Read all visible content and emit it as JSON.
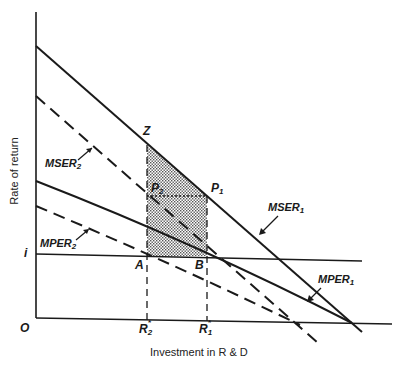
{
  "diagram": {
    "title": "",
    "y_axis_label": "Rate of return",
    "x_axis_label": "Investment in R & D",
    "origin_label": "O",
    "interest_rate_label": "i",
    "curves": [
      {
        "name": "MSER",
        "sub": "1",
        "style": "solid"
      },
      {
        "name": "MSER",
        "sub": "2",
        "style": "dashed"
      },
      {
        "name": "MPER",
        "sub": "1",
        "style": "solid"
      },
      {
        "name": "MPER",
        "sub": "2",
        "style": "dashed"
      }
    ],
    "points": {
      "Z": "Z",
      "P1": "P",
      "P1_sub": "1",
      "P2": "P",
      "P2_sub": "2",
      "A": "A",
      "B": "B"
    },
    "x_ticks": [
      {
        "label": "R",
        "sup": "*",
        "sub": "2"
      },
      {
        "label": "R",
        "sup": "*",
        "sub": "1"
      }
    ],
    "shaded_region": "Z-P1-P2 triangle plus P2-P1-B-A rectangle (stippled)",
    "colors": {
      "line": "#1a1a1a",
      "shade": "#9a9a9a",
      "background": "#ffffff"
    }
  }
}
